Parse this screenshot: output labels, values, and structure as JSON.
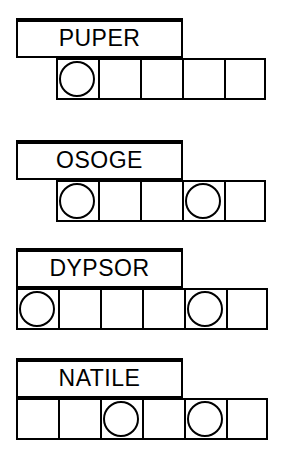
{
  "sheet": {
    "title": "word-grid-worksheet",
    "ink_color": "#000000",
    "paper_color": "#ffffff",
    "cell_size": 42,
    "groups": [
      {
        "id": "group-1",
        "word": "PUPER",
        "label": {
          "left": 16,
          "top": 18,
          "width": 167,
          "height": 40
        },
        "row": {
          "left": 56,
          "top": 58,
          "cells": 5
        },
        "circles": [
          1,
          0,
          0,
          0,
          0
        ]
      },
      {
        "id": "group-2",
        "word": "OSOGE",
        "label": {
          "left": 16,
          "top": 140,
          "width": 167,
          "height": 40
        },
        "row": {
          "left": 56,
          "top": 180,
          "cells": 5
        },
        "circles": [
          1,
          0,
          0,
          1,
          0
        ]
      },
      {
        "id": "group-3",
        "word": "DYPSOR",
        "label": {
          "left": 16,
          "top": 248,
          "width": 167,
          "height": 40
        },
        "row": {
          "left": 16,
          "top": 288,
          "cells": 6
        },
        "circles": [
          1,
          0,
          0,
          0,
          1,
          0
        ]
      },
      {
        "id": "group-4",
        "word": "NATILE",
        "label": {
          "left": 16,
          "top": 358,
          "width": 167,
          "height": 40
        },
        "row": {
          "left": 16,
          "top": 398,
          "cells": 6
        },
        "circles": [
          0,
          0,
          1,
          0,
          1,
          0
        ]
      }
    ]
  }
}
